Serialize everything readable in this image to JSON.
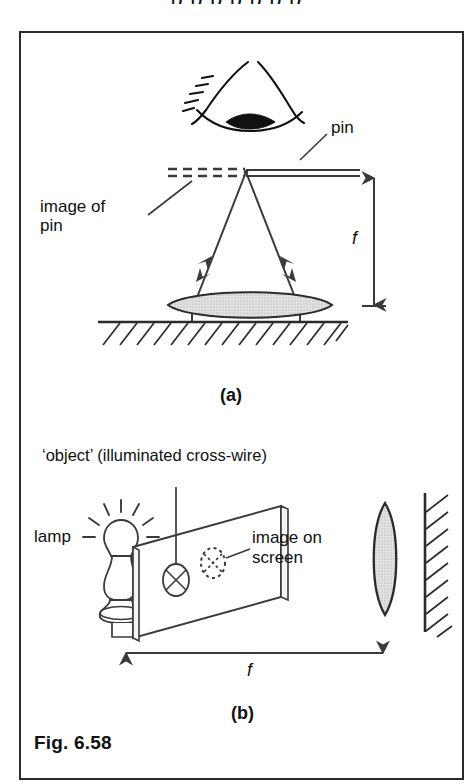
{
  "page": {
    "top_remnant_text": "p p       p  p   p  p  p"
  },
  "figure": {
    "caption": "Fig. 6.58",
    "panels": [
      {
        "id": "a",
        "label": "(a)",
        "annotations": [
          {
            "name": "pin",
            "text": "pin"
          },
          {
            "name": "image-of-pin",
            "text": "image of\npin"
          },
          {
            "name": "focal-length",
            "text": "f"
          }
        ],
        "elements": [
          "eye-icon",
          "pin-line",
          "image-of-pin-dashed-line",
          "ray-left",
          "ray-right",
          "converging-lens-horizontal",
          "ground-hatching",
          "focal-length-arrow-vertical"
        ]
      },
      {
        "id": "b",
        "label": "(b)",
        "annotations": [
          {
            "name": "object-title",
            "text": "‘object’ (illuminated cross-wire)"
          },
          {
            "name": "lamp",
            "text": "lamp"
          },
          {
            "name": "image-on-screen",
            "text": "image on\nscreen"
          },
          {
            "name": "focal-length",
            "text": "f"
          }
        ],
        "elements": [
          "lamp-bulb-icon",
          "lamp-stand-icon",
          "screen-panel",
          "cross-wire-circle-icon",
          "image-dotted-circle-icon",
          "converging-lens-vertical",
          "wall-hatching",
          "focal-length-arrow-horizontal"
        ]
      }
    ]
  },
  "labels": {
    "pin": "pin",
    "image_of_pin_line1": "image of",
    "image_of_pin_line2": "pin",
    "f_a": "f",
    "panel_a": "(a)",
    "object_title": "‘object’ (illuminated cross-wire)",
    "lamp": "lamp",
    "image_on_screen_line1": "image on",
    "image_on_screen_line2": "screen",
    "f_b": "f",
    "panel_b": "(b)",
    "caption": "Fig. 6.58"
  },
  "colors": {
    "ink": "#111111",
    "border": "#2b2b2b",
    "line": "#3a3a3a",
    "lens_fill": "#d6d6d6",
    "paper": "#ffffff"
  }
}
